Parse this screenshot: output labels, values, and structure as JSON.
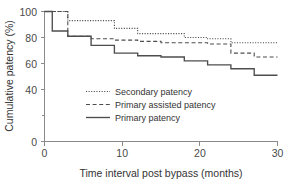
{
  "chart_data": {
    "type": "line",
    "subtype": "kaplan-meier-step",
    "title": "",
    "xlabel": "Time interval post bypass (months)",
    "ylabel": "Cumulative patency (%)",
    "xlim": [
      0,
      30
    ],
    "ylim": [
      0,
      100
    ],
    "xticks": [
      0,
      10,
      20,
      30
    ],
    "xtick_labels": [
      "0",
      "10",
      "20",
      "30"
    ],
    "yticks": [
      0,
      20,
      40,
      60,
      80,
      100
    ],
    "ytick_labels": [
      "0",
      "",
      "40",
      "60",
      "80",
      "100"
    ],
    "grid": false,
    "legend_position": "center",
    "series": [
      {
        "name": "Secondary patency",
        "style": "dotted",
        "color": "#4d4d4d",
        "x": [
          0,
          1,
          3,
          6,
          9,
          12,
          15,
          18,
          21,
          24,
          27,
          30
        ],
        "y": [
          100,
          100,
          93,
          93,
          87,
          83,
          83,
          80,
          79,
          76,
          76,
          76
        ]
      },
      {
        "name": "Primary assisted patency",
        "style": "dashed",
        "color": "#4d4d4d",
        "x": [
          0,
          1,
          3,
          6,
          9,
          12,
          15,
          18,
          21,
          24,
          27,
          30
        ],
        "y": [
          100,
          100,
          81,
          79,
          78,
          77,
          76,
          76,
          75,
          68,
          65,
          65
        ]
      },
      {
        "name": "Primary patency",
        "style": "solid",
        "color": "#4d4d4d",
        "x": [
          0,
          1,
          3,
          6,
          9,
          12,
          15,
          18,
          21,
          24,
          27,
          30
        ],
        "y": [
          100,
          85,
          81,
          74,
          68,
          66,
          65,
          62,
          59,
          56,
          51,
          51
        ]
      }
    ]
  },
  "legend": {
    "items": [
      {
        "label": "Secondary patency"
      },
      {
        "label": "Primary assisted patency"
      },
      {
        "label": "Primary patency"
      }
    ]
  },
  "axes": {
    "x_title": "Time interval post bypass (months)",
    "y_title": "Cumulative patency (%)",
    "x_tick_labels": [
      "0",
      "10",
      "20",
      "30"
    ],
    "y_tick_labels": [
      "100",
      "80",
      "60",
      "40",
      "",
      "0"
    ]
  }
}
